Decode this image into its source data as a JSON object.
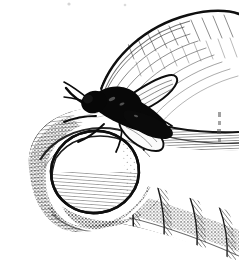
{
  "document": {
    "type": "pen-and-ink line illustration",
    "title": "Insect resting on a human thumb",
    "background_color": "#ffffff",
    "ink_color": "#111111",
    "mid_tone_color": "#5a5a5a",
    "light_tone_color": "#9a9a9a",
    "width_px": 239,
    "height_px": 276,
    "palette": "monochrome",
    "technique": "cross-hatching, stippling, contour hatching"
  },
  "subjects": [
    {
      "id": "hand",
      "name": "Human hand with thumb",
      "description": "A large thumb and curled index finger seen from the side, drawn with contour hatching that follows the curvature of the skin. The thumb points down and to the left, its pad and fingernail facing the viewer.",
      "parts": [
        {
          "id": "thumb-tip",
          "label": "Thumb tip"
        },
        {
          "id": "thumbnail",
          "label": "Thumbnail"
        },
        {
          "id": "index-finger",
          "label": "Index finger"
        },
        {
          "id": "knuckle-creases",
          "label": "Knuckle creases"
        },
        {
          "id": "finger-fold",
          "label": "Finger fold"
        }
      ]
    },
    {
      "id": "insect",
      "name": "Insect",
      "description": "A dark bodied winged insect, like a bee or fly, perched on the upper surface of the thumb near the base of the nail. Its body is rendered in solid black ink; two pale outlined wings sweep back and to the right, and thin legs splay forward.",
      "parts": [
        {
          "id": "insect-body",
          "label": "Body"
        },
        {
          "id": "insect-head",
          "label": "Head"
        },
        {
          "id": "insect-wing-upper",
          "label": "Upper wing"
        },
        {
          "id": "insect-wing-lower",
          "label": "Lower wing"
        },
        {
          "id": "insect-legs",
          "label": "Legs"
        },
        {
          "id": "insect-antennae",
          "label": "Antennae"
        }
      ]
    }
  ],
  "annotations": {
    "edge_marks": "faint scanning speckle near the top edge and right edge",
    "visible_text": ""
  }
}
